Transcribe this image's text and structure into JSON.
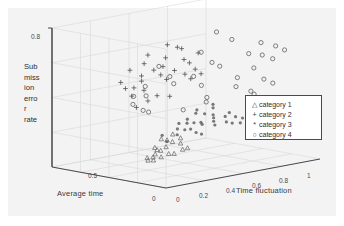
{
  "chart_data": {
    "type": "scatter",
    "title": "",
    "projection": "3d",
    "xlabel": "Time fluctuation",
    "ylabel": "Submission error rate",
    "zlabel": "Average time",
    "ylabel_wrapped": [
      "Sub",
      "miss",
      "ion",
      "erro",
      "r",
      "rate"
    ],
    "xlim": [
      0,
      1
    ],
    "ylim": [
      0,
      0.8
    ],
    "zlim": [
      0,
      1
    ],
    "xticks": [
      "0",
      "0.2",
      "0.4",
      "0.6",
      "0.8",
      "1"
    ],
    "yticks": [
      "0.8"
    ],
    "zticks": [
      "0",
      "0.5"
    ],
    "grid": true,
    "legend_position": "right",
    "series": [
      {
        "name": "category 1",
        "marker": "triangle",
        "color": "#6b6b6b",
        "points": [
          [
            0.1,
            0.12,
            0.3
          ],
          [
            0.13,
            0.14,
            0.27
          ],
          [
            0.16,
            0.11,
            0.33
          ],
          [
            0.12,
            0.17,
            0.24
          ],
          [
            0.18,
            0.15,
            0.29
          ],
          [
            0.15,
            0.09,
            0.36
          ],
          [
            0.21,
            0.13,
            0.26
          ],
          [
            0.09,
            0.19,
            0.22
          ],
          [
            0.23,
            0.16,
            0.31
          ],
          [
            0.19,
            0.21,
            0.2
          ],
          [
            0.26,
            0.12,
            0.28
          ],
          [
            0.14,
            0.23,
            0.18
          ],
          [
            0.28,
            0.18,
            0.25
          ],
          [
            0.22,
            0.1,
            0.34
          ],
          [
            0.31,
            0.15,
            0.23
          ],
          [
            0.17,
            0.26,
            0.17
          ],
          [
            0.25,
            0.22,
            0.21
          ],
          [
            0.33,
            0.13,
            0.3
          ],
          [
            0.2,
            0.08,
            0.38
          ],
          [
            0.11,
            0.24,
            0.19
          ]
        ]
      },
      {
        "name": "category 2",
        "marker": "plus",
        "color": "#4a4a4a",
        "points": [
          [
            0.3,
            0.52,
            0.62
          ],
          [
            0.35,
            0.55,
            0.58
          ],
          [
            0.33,
            0.48,
            0.66
          ],
          [
            0.38,
            0.57,
            0.54
          ],
          [
            0.41,
            0.51,
            0.6
          ],
          [
            0.28,
            0.6,
            0.57
          ],
          [
            0.44,
            0.54,
            0.52
          ],
          [
            0.36,
            0.63,
            0.49
          ],
          [
            0.47,
            0.47,
            0.63
          ],
          [
            0.31,
            0.44,
            0.7
          ],
          [
            0.5,
            0.58,
            0.47
          ],
          [
            0.39,
            0.41,
            0.72
          ],
          [
            0.53,
            0.5,
            0.55
          ],
          [
            0.26,
            0.66,
            0.51
          ],
          [
            0.45,
            0.61,
            0.45
          ],
          [
            0.34,
            0.38,
            0.76
          ],
          [
            0.56,
            0.53,
            0.5
          ],
          [
            0.42,
            0.68,
            0.43
          ],
          [
            0.24,
            0.45,
            0.68
          ],
          [
            0.49,
            0.36,
            0.74
          ],
          [
            0.37,
            0.7,
            0.4
          ],
          [
            0.59,
            0.46,
            0.58
          ],
          [
            0.21,
            0.57,
            0.6
          ],
          [
            0.52,
            0.64,
            0.42
          ],
          [
            0.46,
            0.33,
            0.78
          ],
          [
            0.29,
            0.73,
            0.38
          ],
          [
            0.62,
            0.49,
            0.53
          ],
          [
            0.55,
            0.35,
            0.71
          ],
          [
            0.18,
            0.5,
            0.64
          ],
          [
            0.4,
            0.3,
            0.8
          ]
        ]
      },
      {
        "name": "category 3",
        "marker": "asterisk",
        "color": "#555555",
        "points": [
          [
            0.4,
            0.22,
            0.44
          ],
          [
            0.44,
            0.25,
            0.41
          ],
          [
            0.47,
            0.2,
            0.47
          ],
          [
            0.42,
            0.28,
            0.38
          ],
          [
            0.5,
            0.24,
            0.43
          ],
          [
            0.53,
            0.19,
            0.5
          ],
          [
            0.46,
            0.31,
            0.36
          ],
          [
            0.56,
            0.23,
            0.45
          ],
          [
            0.38,
            0.26,
            0.4
          ],
          [
            0.59,
            0.21,
            0.48
          ],
          [
            0.51,
            0.3,
            0.35
          ],
          [
            0.62,
            0.25,
            0.42
          ],
          [
            0.36,
            0.18,
            0.52
          ],
          [
            0.65,
            0.22,
            0.46
          ],
          [
            0.55,
            0.33,
            0.33
          ],
          [
            0.68,
            0.19,
            0.49
          ],
          [
            0.48,
            0.16,
            0.55
          ],
          [
            0.71,
            0.24,
            0.44
          ],
          [
            0.58,
            0.28,
            0.37
          ],
          [
            0.74,
            0.2,
            0.47
          ],
          [
            0.43,
            0.34,
            0.31
          ],
          [
            0.77,
            0.23,
            0.43
          ],
          [
            0.61,
            0.15,
            0.56
          ],
          [
            0.8,
            0.18,
            0.5
          ],
          [
            0.52,
            0.36,
            0.29
          ],
          [
            0.83,
            0.21,
            0.45
          ],
          [
            0.66,
            0.13,
            0.58
          ],
          [
            0.86,
            0.17,
            0.51
          ],
          [
            0.45,
            0.12,
            0.6
          ],
          [
            0.7,
            0.27,
            0.39
          ]
        ]
      },
      {
        "name": "category 4",
        "marker": "circle",
        "color": "#5a5a5a",
        "points": [
          [
            0.55,
            0.77,
            0.3
          ],
          [
            0.62,
            0.72,
            0.26
          ],
          [
            0.48,
            0.66,
            0.34
          ],
          [
            0.7,
            0.63,
            0.22
          ],
          [
            0.58,
            0.58,
            0.38
          ],
          [
            0.75,
            0.69,
            0.18
          ],
          [
            0.66,
            0.54,
            0.42
          ],
          [
            0.81,
            0.6,
            0.25
          ],
          [
            0.52,
            0.5,
            0.46
          ],
          [
            0.86,
            0.65,
            0.2
          ],
          [
            0.73,
            0.47,
            0.36
          ],
          [
            0.9,
            0.56,
            0.28
          ],
          [
            0.6,
            0.43,
            0.5
          ],
          [
            0.94,
            0.61,
            0.23
          ],
          [
            0.78,
            0.4,
            0.44
          ],
          [
            0.45,
            0.46,
            0.54
          ],
          [
            0.84,
            0.37,
            0.39
          ],
          [
            0.68,
            0.34,
            0.56
          ],
          [
            0.38,
            0.52,
            0.48
          ],
          [
            0.88,
            0.44,
            0.33
          ],
          [
            0.3,
            0.41,
            0.58
          ],
          [
            0.92,
            0.33,
            0.47
          ],
          [
            0.25,
            0.48,
            0.52
          ],
          [
            0.72,
            0.3,
            0.62
          ],
          [
            0.2,
            0.38,
            0.56
          ],
          [
            0.96,
            0.4,
            0.36
          ],
          [
            0.34,
            0.31,
            0.66
          ],
          [
            0.63,
            0.26,
            0.7
          ],
          [
            0.16,
            0.44,
            0.5
          ],
          [
            0.28,
            0.6,
            0.44
          ],
          [
            0.42,
            0.28,
            0.72
          ],
          [
            0.8,
            0.52,
            0.31
          ]
        ]
      }
    ]
  },
  "axes": {
    "xlabel": "Time fluctuation",
    "zlabel": "Average time",
    "ylabel_lines": [
      "Sub",
      "miss",
      "ion",
      "erro",
      "r",
      "rate"
    ],
    "ytick_top": "0.8",
    "ztick_mid": "0.5",
    "origin_tick_left": "0",
    "origin_tick_right": "0",
    "xticks": [
      "0.2",
      "0.4",
      "0.6",
      "0.8",
      "1"
    ]
  },
  "legend": {
    "entries": [
      {
        "marker": "△",
        "label": "category 1"
      },
      {
        "marker": "+",
        "label": "category 2"
      },
      {
        "marker": "*",
        "label": "category 3"
      },
      {
        "marker": "○",
        "label": "category 4"
      }
    ]
  },
  "colors": {
    "panel": "#f3f3f3",
    "axis": "#4a4a4a",
    "grid": "#d8d8d8",
    "marker": "#555555"
  }
}
